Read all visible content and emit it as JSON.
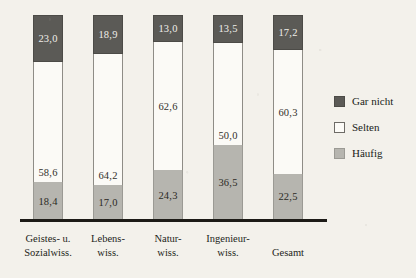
{
  "chart_data": {
    "type": "bar",
    "subtype": "stacked-100",
    "title": "",
    "xlabel": "",
    "ylabel": "",
    "ylim": [
      0,
      100
    ],
    "grid": false,
    "legend_position": "right",
    "categories": [
      "Geistes- u. Sozialwiss.",
      "Lebens- wiss.",
      "Natur- wiss.",
      "Ingenieur- wiss.",
      "Gesamt"
    ],
    "category_lines": [
      [
        "Geistes- u.",
        "Sozialwiss."
      ],
      [
        "Lebens-",
        "wiss."
      ],
      [
        "Natur-",
        "wiss."
      ],
      [
        "Ingenieur-",
        "wiss."
      ],
      [
        "Gesamt",
        ""
      ]
    ],
    "series": [
      {
        "name": "Gar nicht",
        "color": "#5b5a56",
        "values": [
          23.0,
          18.9,
          13.0,
          13.5,
          17.2
        ],
        "labels": [
          "23,0",
          "18,9",
          "13,0",
          "13,5",
          "17,2"
        ]
      },
      {
        "name": "Selten",
        "color": "#fbfaf6",
        "values": [
          58.6,
          64.2,
          62.6,
          50.0,
          60.3
        ],
        "labels": [
          "58,6",
          "64,2",
          "62,6",
          "50,0",
          "60,3"
        ]
      },
      {
        "name": "Häufig",
        "color": "#b6b5af",
        "values": [
          18.4,
          17.0,
          24.3,
          36.5,
          22.5
        ],
        "labels": [
          "18,4",
          "17,0",
          "24,3",
          "36,5",
          "22,5"
        ]
      }
    ],
    "legend": [
      {
        "label": "Gar nicht",
        "swatch": "dark-gray"
      },
      {
        "label": "Selten",
        "swatch": "white"
      },
      {
        "label": "Häufig",
        "swatch": "light-gray"
      }
    ]
  }
}
